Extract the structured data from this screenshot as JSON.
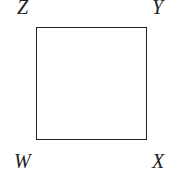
{
  "diagram": {
    "shape": "square",
    "vertices": {
      "top_left": "Z",
      "top_right": "Y",
      "bottom_left": "W",
      "bottom_right": "X"
    },
    "stroke_color": "#222222",
    "background": "#ffffff"
  }
}
